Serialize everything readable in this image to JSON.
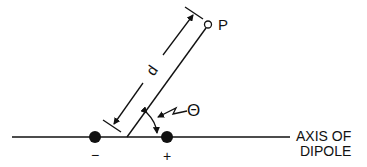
{
  "diagram": {
    "type": "electric-dipole-geometry",
    "colors": {
      "ink": "#111111",
      "background": "#ffffff"
    },
    "labels": {
      "point": "P",
      "distance": "d",
      "angle": "Θ",
      "negative_charge": "−",
      "positive_charge": "+",
      "axis_line1": "AXIS OF",
      "axis_line2": "DIPOLE"
    }
  }
}
